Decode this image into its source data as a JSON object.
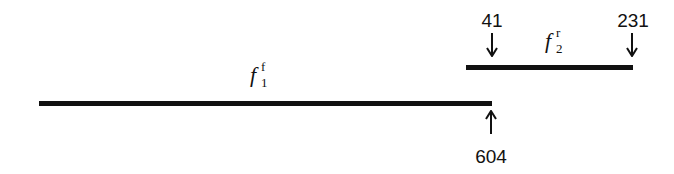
{
  "fragments": [
    {
      "name": "f",
      "sub": "1",
      "sup": "f",
      "start_label": "",
      "end_label": "604"
    },
    {
      "name": "f",
      "sub": "2",
      "sup": "r",
      "start_label": "41",
      "end_label": "231"
    }
  ],
  "colors": {
    "line": "#111111",
    "background": "#ffffff"
  }
}
